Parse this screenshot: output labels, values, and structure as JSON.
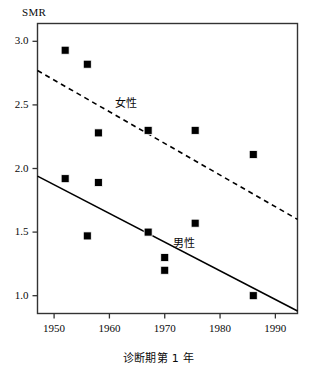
{
  "chart_data": {
    "type": "scatter",
    "title": "",
    "xlabel": "诊断期第 1 年",
    "ylabel": "SMR",
    "xlim": [
      1947,
      1994
    ],
    "ylim": [
      0.86,
      3.14
    ],
    "xticks": [
      1950,
      1960,
      1970,
      1980,
      1990
    ],
    "xtick_labels": [
      "1950",
      "1960",
      "1970",
      "1980",
      "1990"
    ],
    "yticks": [
      1.0,
      1.5,
      2.0,
      2.5,
      3.0
    ],
    "ytick_labels": [
      "1.0",
      "1.5",
      "2.0",
      "2.5",
      "3.0"
    ],
    "grid": false,
    "legend_position": "inline-annotation",
    "marker": "filled-square",
    "marker_color": "#000000",
    "series": [
      {
        "name": "女性",
        "label": "女性",
        "line_style": "dashed",
        "line_color": "#000000",
        "annotation_x": 1963.5,
        "annotation_y": 2.52,
        "points": [
          {
            "x": 1952,
            "y": 2.93
          },
          {
            "x": 1956,
            "y": 2.82
          },
          {
            "x": 1958,
            "y": 2.28
          },
          {
            "x": 1967,
            "y": 2.3
          },
          {
            "x": 1975.5,
            "y": 2.3
          },
          {
            "x": 1986,
            "y": 2.11
          }
        ],
        "fit_line": {
          "x1": 1947,
          "y1": 2.77,
          "x2": 1994,
          "y2": 1.6
        }
      },
      {
        "name": "男性",
        "label": "男性",
        "line_style": "solid",
        "line_color": "#000000",
        "annotation_x": 1974,
        "annotation_y": 1.42,
        "points": [
          {
            "x": 1952,
            "y": 1.92
          },
          {
            "x": 1956,
            "y": 1.47
          },
          {
            "x": 1958,
            "y": 1.89
          },
          {
            "x": 1967,
            "y": 1.5
          },
          {
            "x": 1970,
            "y": 1.3
          },
          {
            "x": 1970,
            "y": 1.2
          },
          {
            "x": 1975.5,
            "y": 1.57
          },
          {
            "x": 1986,
            "y": 1.0
          }
        ],
        "fit_line": {
          "x1": 1947,
          "y1": 1.94,
          "x2": 1994,
          "y2": 0.88
        }
      }
    ]
  },
  "axes": {
    "frame_color": "#333333",
    "y_axis_caption": "SMR",
    "x_axis_caption": "诊断期第 1 年"
  }
}
